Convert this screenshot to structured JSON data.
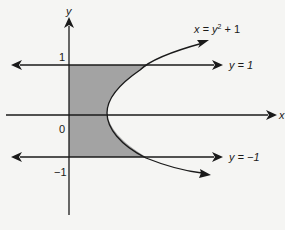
{
  "diagram": {
    "axes": {
      "x_label": "x",
      "y_label": "y",
      "origin_label": "0",
      "tick_y_pos": "1",
      "tick_y_neg": "−1"
    },
    "curve": {
      "equation_lhs": "x = y",
      "equation_exp": "2",
      "equation_rhs": " + 1"
    },
    "lines": {
      "upper": {
        "label": "y = 1",
        "value": 1
      },
      "lower": {
        "label": "y = −1",
        "value": -1
      }
    },
    "shaded_region": {
      "description": "Region bounded by x = 0, y = 1, y = -1 and x = y^2 + 1",
      "fill_color": "#a3a3a3"
    },
    "colors": {
      "stroke": "#1a1a1a",
      "background": "#f5f5f3"
    }
  }
}
